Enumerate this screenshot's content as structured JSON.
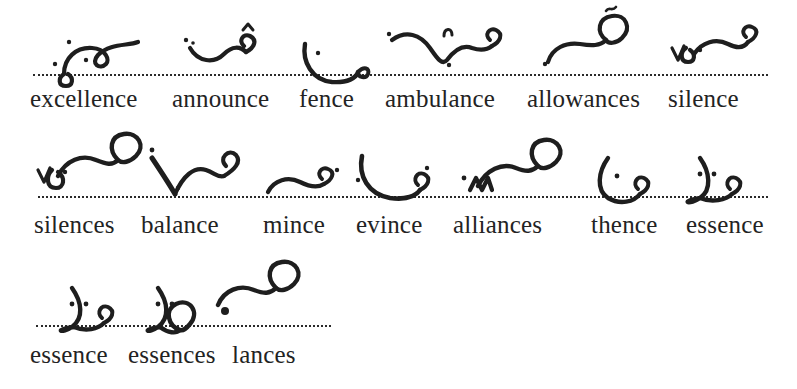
{
  "page": {
    "kind": "shorthand-plate",
    "background_color": "#ffffff",
    "ink_color": "#1e1e1e",
    "text_color": "#232323",
    "baseline_style": "dotted"
  },
  "rows": [
    {
      "id": "row-1",
      "baseline_y": 74,
      "baseline_left": 33,
      "baseline_width": 735,
      "label_baseline_y": 105,
      "entries": [
        {
          "word": "excellence",
          "label_x": 30,
          "outline_x": 48,
          "outline_kind": "loop-hook-right-dotvowel"
        },
        {
          "word": "announce",
          "label_x": 172,
          "outline_x": 186,
          "outline_kind": "shallow-curve-with-caret-and-hook"
        },
        {
          "word": "fence",
          "label_x": 299,
          "outline_x": 300,
          "outline_kind": "deep-curve-under-baseline-hook"
        },
        {
          "word": "ambulance",
          "label_x": 385,
          "outline_x": 390,
          "outline_kind": "v-dip-caret-then-hook"
        },
        {
          "word": "allowances",
          "label_x": 527,
          "outline_x": 545,
          "outline_kind": "rise-to-large-circle-tilde"
        },
        {
          "word": "silence",
          "label_x": 668,
          "outline_x": 672,
          "outline_kind": "v6-then-wave-hook"
        }
      ]
    },
    {
      "id": "row-2",
      "baseline_y": 196,
      "baseline_left": 38,
      "baseline_width": 730,
      "label_baseline_y": 232,
      "entries": [
        {
          "word": "silences",
          "label_x": 34,
          "outline_x": 44,
          "outline_kind": "v6-loop-large-circle"
        },
        {
          "word": "balance",
          "label_x": 141,
          "outline_x": 148,
          "outline_kind": "down-stroke-v-then-wave-hook"
        },
        {
          "word": "mince",
          "label_x": 263,
          "outline_x": 266,
          "outline_kind": "low-hump-then-hook"
        },
        {
          "word": "evince",
          "label_x": 356,
          "outline_x": 358,
          "outline_kind": "tall-curve-dip-hook"
        },
        {
          "word": "alliances",
          "label_x": 453,
          "outline_x": 466,
          "outline_kind": "zigzag-rise-large-circle"
        },
        {
          "word": "thence",
          "label_x": 591,
          "outline_x": 598,
          "outline_kind": "left-bracket-curve-hook"
        },
        {
          "word": "essence",
          "label_x": 686,
          "outline_x": 690,
          "outline_kind": "right-bracket-curve-hook"
        }
      ]
    },
    {
      "id": "row-3",
      "baseline_y": 325,
      "baseline_left": 36,
      "baseline_width": 295,
      "label_baseline_y": 362,
      "entries": [
        {
          "word": "essence",
          "label_x": 30,
          "outline_x": 62,
          "outline_kind": "bracket-curve-small-hook"
        },
        {
          "word": "essences",
          "label_x": 128,
          "outline_x": 148,
          "outline_kind": "bracket-curve-large-circle"
        },
        {
          "word": "lances",
          "label_x": 232,
          "outline_x": 216,
          "outline_kind": "heavy-dot-rise-large-circle"
        }
      ]
    }
  ]
}
